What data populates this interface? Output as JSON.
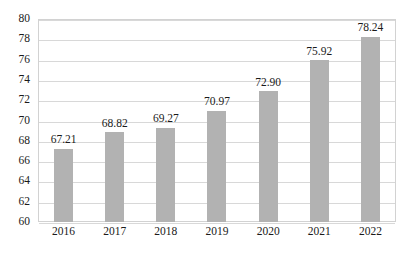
{
  "chart_data": {
    "type": "bar",
    "title": "",
    "subtitle": "",
    "xlabel": "",
    "ylabel": "",
    "categories": [
      "2016",
      "2017",
      "2018",
      "2019",
      "2020",
      "2021",
      "2022"
    ],
    "values": [
      67.21,
      68.82,
      69.27,
      70.97,
      72.9,
      75.92,
      78.24
    ],
    "data_labels": [
      "67.21",
      "68.82",
      "69.27",
      "70.97",
      "72.90",
      "75.92",
      "78.24"
    ],
    "ylim": [
      60,
      80
    ],
    "ytick_step": 2,
    "ytick_labels": [
      "80",
      "78",
      "76",
      "74",
      "72",
      "70",
      "68",
      "66",
      "64",
      "62",
      "60"
    ],
    "grid": true,
    "legend": null,
    "legend_position": "none",
    "bar_color": "#b2b2b2",
    "grid_color": "#d8d8d8",
    "axis_color": "#d2d2d2",
    "text_color": "#1a1a1a"
  }
}
